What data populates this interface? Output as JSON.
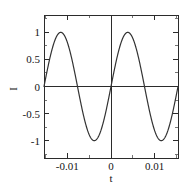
{
  "figure": {
    "background_color": "#ffffff",
    "curve_color": "#333333",
    "axis_color": "#2b2b2b",
    "text_color": "#141414"
  },
  "plot_area": {
    "left_px": 44,
    "top_px": 15,
    "right_px": 178,
    "bottom_px": 158
  },
  "chart_data": {
    "type": "line",
    "title": "",
    "xlabel": "t",
    "ylabel": "I",
    "xlim": [
      -0.01534,
      0.01534
    ],
    "ylim": [
      -1.32,
      1.32
    ],
    "grid": false,
    "legend": null,
    "x_ticks": [
      -0.01,
      0,
      0.01
    ],
    "x_tick_labels": [
      "-0.01",
      "0",
      "0.01"
    ],
    "y_ticks": [
      -1,
      -0.5,
      0,
      0.5,
      1
    ],
    "y_tick_labels": [
      "-1",
      "-0.5",
      "0",
      "0.5",
      "1"
    ],
    "x_minor_ticks": [
      -0.015,
      -0.005,
      0.005,
      0.015
    ],
    "y_minor_ticks": [
      -1.25,
      -0.75,
      -0.25,
      0.25,
      0.75,
      1.25
    ],
    "series": [
      {
        "name": "I(t)",
        "function": "sine",
        "amplitude": 1,
        "period": 0.01534,
        "phase": 0,
        "description": "Sine wave spanning two full periods, zero at the left edge, at t=0 and at the right edge.",
        "x": [
          -0.01534,
          -0.01438,
          -0.01342,
          -0.01246,
          -0.0115,
          -0.01054,
          -0.00959,
          -0.00863,
          -0.00767,
          -0.00671,
          -0.00575,
          -0.00479,
          -0.00384,
          -0.00288,
          -0.00192,
          -0.00096,
          0,
          0.00096,
          0.00192,
          0.00288,
          0.00384,
          0.00479,
          0.00575,
          0.00671,
          0.00767,
          0.00863,
          0.00959,
          0.01054,
          0.0115,
          0.01246,
          0.01342,
          0.01438,
          0.01534
        ],
        "y": [
          0,
          0.383,
          0.707,
          0.924,
          1,
          0.924,
          0.707,
          0.383,
          0,
          -0.383,
          -0.707,
          -0.924,
          -1,
          -0.924,
          -0.707,
          -0.383,
          0,
          0.383,
          0.707,
          0.924,
          1,
          0.924,
          0.707,
          0.383,
          0,
          -0.383,
          -0.707,
          -0.924,
          -1,
          -0.924,
          -0.707,
          -0.383,
          0
        ]
      }
    ]
  }
}
